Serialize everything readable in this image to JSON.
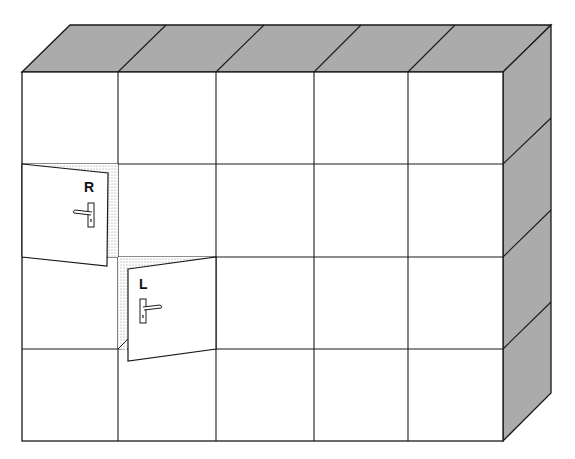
{
  "diagram": {
    "colors": {
      "face": "#ffffff",
      "shaded": "#a9a9a9",
      "line": "#1a1a1a",
      "stipple": "#9a9a9a"
    },
    "grid": {
      "columns": 5,
      "rows": 4
    },
    "doors": [
      {
        "label": "R",
        "hinge": "left",
        "position": "row 2, column 1"
      },
      {
        "label": "L",
        "hinge": "left",
        "position": "row 3, column 2"
      }
    ],
    "icons": [
      {
        "name": "door-handle-icon",
        "description": "lever handle with keyhole plate"
      }
    ]
  }
}
